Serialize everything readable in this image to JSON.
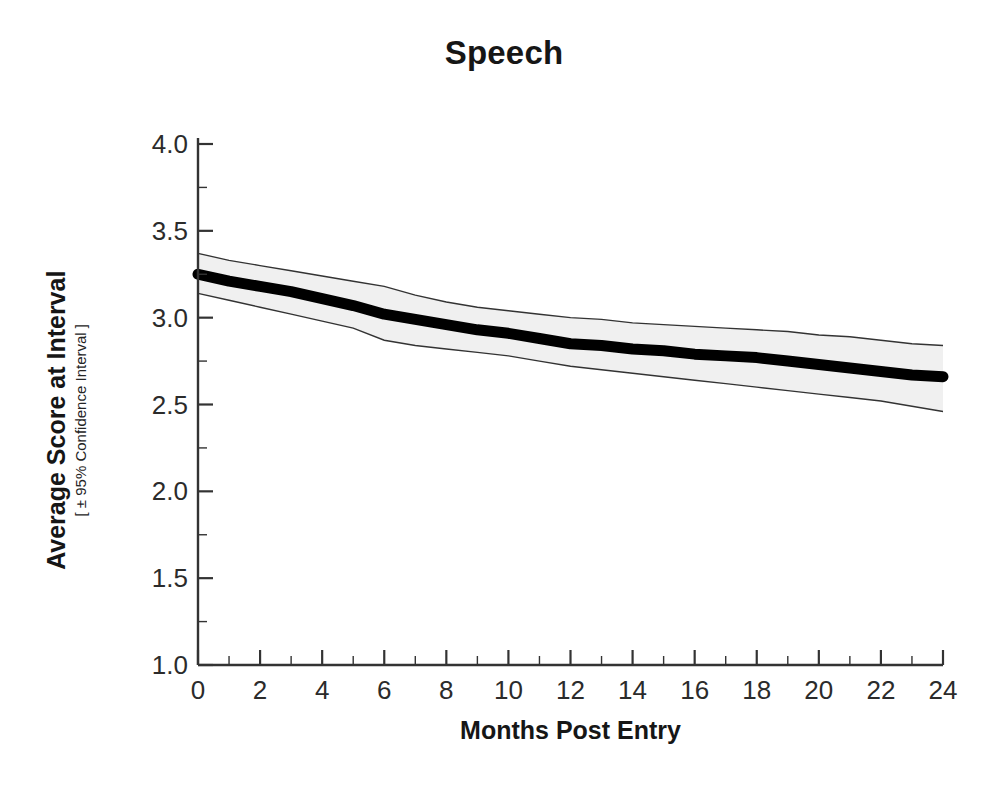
{
  "chart_data": {
    "type": "line",
    "title": "Speech",
    "xlabel": "Months Post Entry",
    "ylabel": "Average Score at Interval",
    "ylabel_sub": "[ ± 95% Confidence Interval ]",
    "xlim": [
      0,
      24
    ],
    "ylim": [
      1.0,
      4.0
    ],
    "grid": false,
    "legend": "none",
    "x_major_ticks": [
      0,
      2,
      4,
      6,
      8,
      10,
      12,
      14,
      16,
      18,
      20,
      22,
      24
    ],
    "x_minor_ticks": [
      1,
      3,
      5,
      7,
      9,
      11,
      13,
      15,
      17,
      19,
      21,
      23
    ],
    "x_tick_labels": [
      "0",
      "2",
      "4",
      "6",
      "8",
      "10",
      "12",
      "14",
      "16",
      "18",
      "20",
      "22",
      "24"
    ],
    "y_major_ticks": [
      1.0,
      1.5,
      2.0,
      2.5,
      3.0,
      3.5,
      4.0
    ],
    "y_minor_ticks": [
      1.25,
      1.75,
      2.25,
      2.75,
      3.25,
      3.75
    ],
    "y_tick_labels": [
      "1.0",
      "1.5",
      "2.0",
      "2.5",
      "3.0",
      "3.5",
      "4.0"
    ],
    "x": [
      0,
      1,
      2,
      3,
      4,
      5,
      6,
      7,
      8,
      9,
      10,
      11,
      12,
      13,
      14,
      15,
      16,
      17,
      18,
      19,
      20,
      21,
      22,
      23,
      24
    ],
    "series": [
      {
        "name": "Average Score at Interval",
        "values": [
          3.25,
          3.21,
          3.18,
          3.15,
          3.11,
          3.07,
          3.02,
          2.99,
          2.96,
          2.93,
          2.91,
          2.88,
          2.85,
          2.84,
          2.82,
          2.81,
          2.79,
          2.78,
          2.77,
          2.75,
          2.73,
          2.71,
          2.69,
          2.67,
          2.66
        ],
        "style": "thick-black-line",
        "color": "#000000"
      }
    ],
    "band": {
      "name": "95% Confidence Interval",
      "upper": [
        3.37,
        3.33,
        3.3,
        3.27,
        3.24,
        3.21,
        3.18,
        3.13,
        3.09,
        3.06,
        3.04,
        3.02,
        3.0,
        2.99,
        2.97,
        2.96,
        2.95,
        2.94,
        2.93,
        2.92,
        2.9,
        2.89,
        2.87,
        2.85,
        2.84
      ],
      "lower": [
        3.14,
        3.1,
        3.06,
        3.02,
        2.98,
        2.94,
        2.87,
        2.84,
        2.82,
        2.8,
        2.78,
        2.75,
        2.72,
        2.7,
        2.68,
        2.66,
        2.64,
        2.62,
        2.6,
        2.58,
        2.56,
        2.54,
        2.52,
        2.49,
        2.46
      ],
      "fill_color": "#f0f0f0",
      "edge_color": "#333333"
    },
    "axis_color": "#333333",
    "background_color": "#ffffff"
  }
}
